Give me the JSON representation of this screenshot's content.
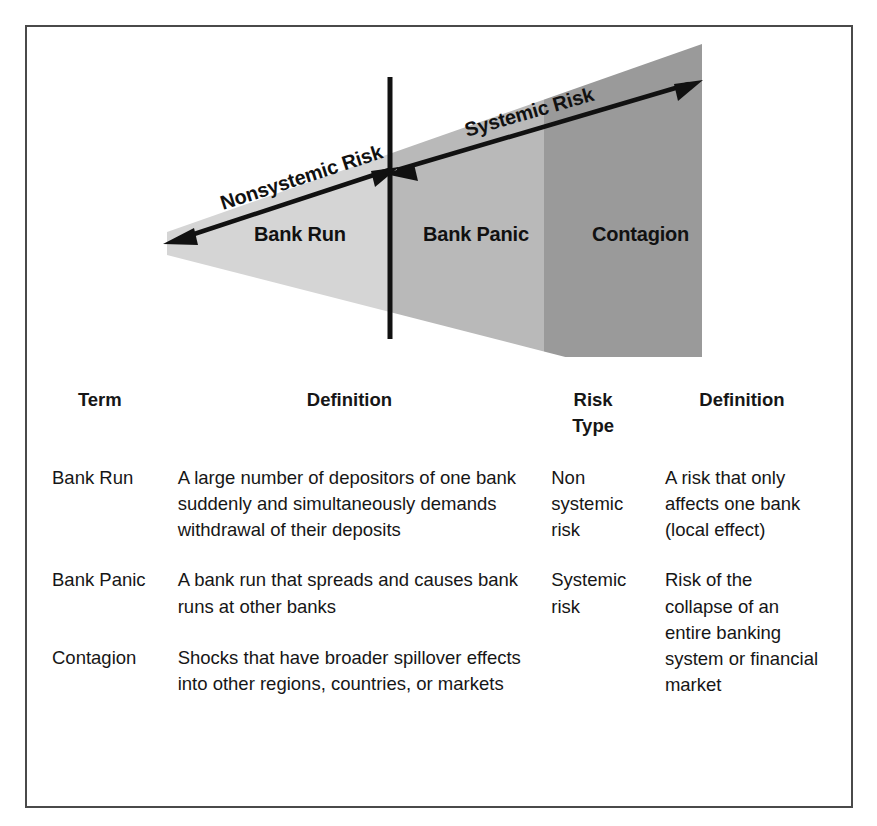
{
  "diagram": {
    "arrows": [
      {
        "id": "nonsystemic",
        "label": "Nonsystemic Risk"
      },
      {
        "id": "systemic",
        "label": "Systemic Risk"
      }
    ],
    "bands": [
      {
        "id": "bank-run",
        "label": "Bank Run",
        "color": "#d5d5d5"
      },
      {
        "id": "bank-panic",
        "label": "Bank Panic",
        "color": "#b9b9b9"
      },
      {
        "id": "contagion",
        "label": "Contagion",
        "color": "#9a9a9a"
      }
    ],
    "divider_line": "vertical-black-divider",
    "colors": {
      "light_gray": "#d5d5d5",
      "medium_gray": "#b9b9b9",
      "dark_gray": "#9a9a9a",
      "arrow": "#111111",
      "frame": "#4a4a4a"
    }
  },
  "table": {
    "headers": {
      "term": "Term",
      "definition1": "Definition",
      "risk_type": "Risk Type",
      "definition2": "Definition"
    },
    "rows": [
      {
        "term": "Bank Run",
        "definition": "A large number of depositors of one bank suddenly and simultaneously demands withdrawal of their deposits"
      },
      {
        "term": "Bank Panic",
        "definition": "A bank run that spreads and causes bank runs at other banks"
      },
      {
        "term": "Contagion",
        "definition": "Shocks that have broader spillover effects into other regions, countries, or markets"
      }
    ],
    "risk_groups": [
      {
        "risk_type": "Non systemic risk",
        "definition": "A risk that only affects one bank (local effect)",
        "rowspan": 1
      },
      {
        "risk_type": "Systemic risk",
        "definition": "Risk of the collapse of an entire banking system or financial market",
        "rowspan": 2
      }
    ]
  }
}
